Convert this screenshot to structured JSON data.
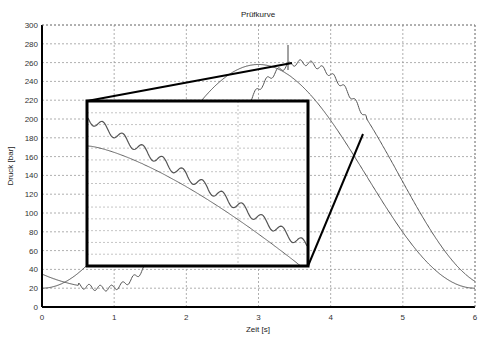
{
  "chart_data": {
    "type": "line",
    "title": "Prüfkurve",
    "xlabel": "Zeit [s]",
    "ylabel": "Druck [bar]",
    "xlim": [
      0,
      6
    ],
    "ylim": [
      0,
      300
    ],
    "xticks": [
      "0",
      "1",
      "2",
      "3",
      "4",
      "5",
      "6"
    ],
    "yticks": [
      "0",
      "20",
      "40",
      "60",
      "80",
      "100",
      "120",
      "140",
      "160",
      "180",
      "200",
      "220",
      "240",
      "260",
      "280",
      "300"
    ],
    "grid": true,
    "legend": null,
    "series": [
      {
        "name": "Kurve 1 (glatt)",
        "color": "#555555",
        "x": [
          0,
          0.5,
          1.0,
          1.5,
          2.0,
          2.5,
          3.0,
          3.5,
          4.0,
          4.5,
          5.0,
          5.5,
          6.0
        ],
        "y": [
          20,
          27,
          52,
          90,
          150,
          215,
          258,
          238,
          180,
          115,
          60,
          28,
          20
        ]
      },
      {
        "name": "Kurve 2 (mit Welligkeit)",
        "color": "#555555",
        "x": [
          0,
          0.5,
          0.9,
          1.5,
          2.0,
          2.5,
          3.0,
          3.4,
          3.5,
          3.8,
          4.0,
          4.5,
          5.0,
          5.5,
          6.0
        ],
        "y": [
          35,
          25,
          20,
          40,
          110,
          175,
          230,
          258,
          260,
          245,
          225,
          180,
          130,
          75,
          35
        ]
      }
    ],
    "annotations": [
      {
        "type": "marker-line",
        "x": 3.45,
        "y_from": 245,
        "y_to": 270
      },
      {
        "type": "zoom-inset",
        "label": "Ausschnitt Welligkeit",
        "rect_px": [
          87,
          101,
          308,
          266
        ],
        "source_x": [
          3.4,
          4.45
        ],
        "source_y": [
          183,
          258
        ]
      }
    ]
  }
}
